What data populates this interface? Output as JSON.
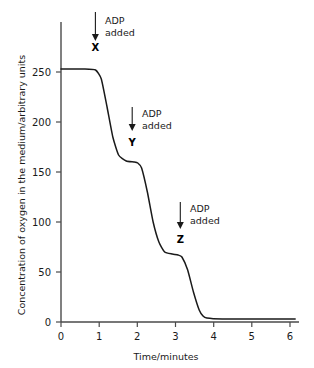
{
  "chart_data": {
    "type": "line",
    "title": "",
    "xlabel": "Time/minutes",
    "ylabel": "Concentration of oxygen in the medium/arbitrary units",
    "xlim": [
      0,
      6.2
    ],
    "ylim": [
      0,
      262
    ],
    "xticks": [
      0,
      1,
      2,
      3,
      4,
      5,
      6
    ],
    "xtick_labels": [
      "0",
      "1",
      "2",
      "3",
      "4",
      "5",
      "6"
    ],
    "yticks": [
      0,
      50,
      100,
      150,
      200,
      250
    ],
    "ytick_labels": [
      "0",
      "50",
      "100",
      "150",
      "200",
      "250"
    ],
    "grid": false,
    "legend": "none",
    "series": [
      {
        "name": "oxygen concentration",
        "color": "#1a1a1a",
        "x": [
          0.0,
          0.6,
          0.9,
          1.05,
          1.2,
          1.35,
          1.5,
          1.7,
          1.9,
          2.0,
          2.1,
          2.25,
          2.4,
          2.55,
          2.7,
          2.9,
          3.05,
          3.15,
          3.3,
          3.45,
          3.6,
          3.7,
          3.8,
          4.2,
          5.0,
          6.1
        ],
        "y": [
          253,
          253,
          252,
          243,
          215,
          185,
          167,
          161,
          160,
          159,
          154,
          130,
          100,
          80,
          70,
          68,
          67,
          65,
          52,
          30,
          12,
          6,
          4,
          3,
          3,
          3
        ]
      }
    ],
    "annotations": [
      {
        "id": "X",
        "label_line1": "ADP",
        "label_line2": "added",
        "point_label": "X",
        "arrow_x": 0.9,
        "arrow_y_top": 262,
        "arrow_y_bottom": 233
      },
      {
        "id": "Y",
        "label_line1": "ADP",
        "label_line2": "added",
        "point_label": "Y",
        "arrow_x": 1.86,
        "arrow_y_top": 215,
        "arrow_y_bottom": 194
      },
      {
        "id": "Z",
        "label_line1": "ADP",
        "label_line2": "added",
        "point_label": "Z",
        "arrow_x": 3.12,
        "arrow_y_top": 120,
        "arrow_y_bottom": 95
      }
    ]
  },
  "colors": {
    "curve": "#1a1a1a",
    "axis": "#4a4a4a",
    "text": "#1a1a1a",
    "background": "#ffffff"
  }
}
